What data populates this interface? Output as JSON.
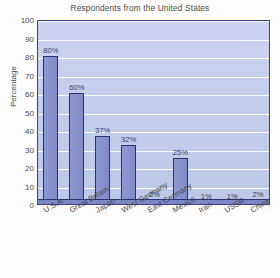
{
  "chart_data": {
    "type": "bar",
    "title": "Respondents from the United States",
    "xlabel": "",
    "ylabel": "Percentage",
    "ylim": [
      0,
      100
    ],
    "y_ticks": [
      0,
      10,
      20,
      30,
      40,
      50,
      60,
      70,
      80,
      90,
      100
    ],
    "grid": true,
    "legend": null,
    "categories": [
      "U.S.A.",
      "Great Britain",
      "Japan",
      "West Germany",
      "East Germany",
      "Mexico",
      "Iran",
      "USSR",
      "China"
    ],
    "values": [
      80,
      60,
      37,
      32,
      2,
      25,
      1,
      1,
      2
    ],
    "data_labels": [
      "80%",
      "60%",
      "37%",
      "32%",
      "2%",
      "25%",
      "1%",
      "1%",
      "2%"
    ],
    "colors": {
      "bar_fill": "#8793cd",
      "bar_outline": "#2b2f72",
      "plot_background": "#c4cfea",
      "gridline": "#ffffff",
      "axis_border": "#3b3f8f",
      "text": "#4a4a4a",
      "page_background": "#fdfdfd"
    }
  }
}
